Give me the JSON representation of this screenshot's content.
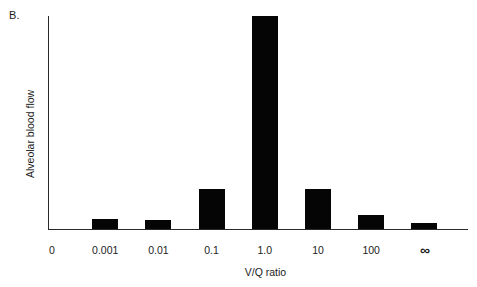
{
  "panel": {
    "label": "B."
  },
  "chart_data": {
    "type": "bar",
    "title": "",
    "subtitle": "",
    "xlabel": "V/Q ratio",
    "ylabel": "Alveolar blood flow",
    "categories": [
      "0",
      "0.001",
      "0.01",
      "0.1",
      "1.0",
      "10",
      "100",
      "∞"
    ],
    "values": [
      0,
      4.5,
      4,
      19,
      100,
      19,
      6.5,
      3
    ],
    "value_unit": "percent of peak alveolar blood flow",
    "ylim": [
      0,
      100
    ],
    "yticks": [],
    "ytick_labels": [],
    "grid": false,
    "legend": false,
    "legend_position": "none",
    "bar_color": "#050505",
    "axis_color": "#2a2a2a",
    "background_color": "#ffffff",
    "bars": [
      {
        "category": "0",
        "value": 0,
        "drawn": false
      },
      {
        "category": "0.001",
        "value": 4.5,
        "drawn": true
      },
      {
        "category": "0.01",
        "value": 4,
        "drawn": true
      },
      {
        "category": "0.1",
        "value": 19,
        "drawn": true
      },
      {
        "category": "1.0",
        "value": 100,
        "drawn": true
      },
      {
        "category": "10",
        "value": 19,
        "drawn": true
      },
      {
        "category": "100",
        "value": 6.5,
        "drawn": true
      },
      {
        "category": "∞",
        "value": 3,
        "drawn": true
      }
    ]
  }
}
